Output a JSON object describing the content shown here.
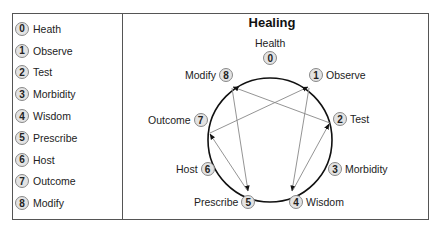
{
  "legend": {
    "items": [
      {
        "num": "0",
        "label": "Heath"
      },
      {
        "num": "1",
        "label": "Observe"
      },
      {
        "num": "2",
        "label": "Test"
      },
      {
        "num": "3",
        "label": "Morbidity"
      },
      {
        "num": "4",
        "label": "Wisdom"
      },
      {
        "num": "5",
        "label": "Prescribe"
      },
      {
        "num": "6",
        "label": "Host"
      },
      {
        "num": "7",
        "label": "Outcome"
      },
      {
        "num": "8",
        "label": "Modify"
      }
    ]
  },
  "diagram": {
    "title": "Healing",
    "nodes": [
      {
        "num": "0",
        "label": "Health"
      },
      {
        "num": "1",
        "label": "Observe"
      },
      {
        "num": "2",
        "label": "Test"
      },
      {
        "num": "3",
        "label": "Morbidity"
      },
      {
        "num": "4",
        "label": "Wisdom"
      },
      {
        "num": "5",
        "label": "Prescribe"
      },
      {
        "num": "6",
        "label": "Host"
      },
      {
        "num": "7",
        "label": "Outcome"
      },
      {
        "num": "8",
        "label": "Modify"
      }
    ],
    "arrows": [
      {
        "from": "8",
        "to": "5"
      },
      {
        "from": "1",
        "to": "4"
      },
      {
        "from": "2",
        "to": "8"
      },
      {
        "from": "7",
        "to": "1"
      },
      {
        "from": "5",
        "to": "7"
      },
      {
        "from": "4",
        "to": "2"
      }
    ]
  }
}
